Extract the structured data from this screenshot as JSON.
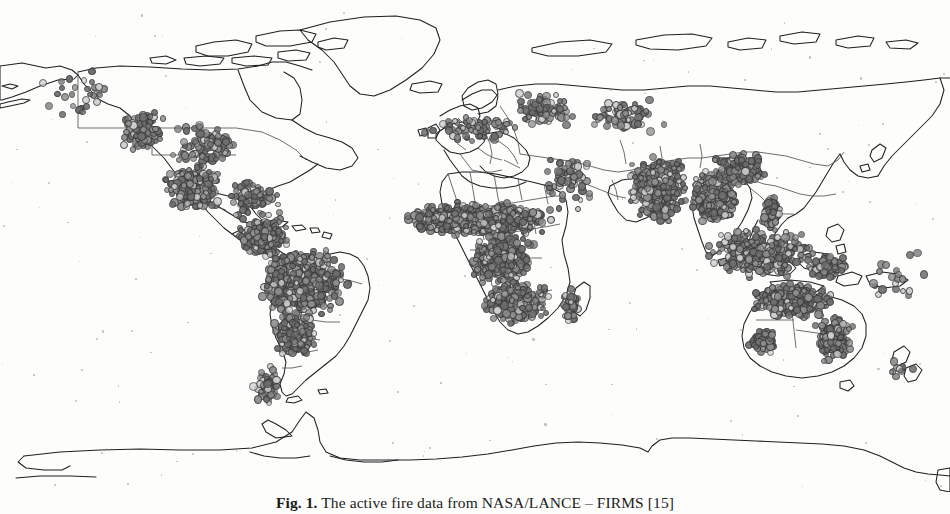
{
  "figure": {
    "label": "Fig. 1.",
    "caption_text": " The active fire data from NASA/LANCE – FIRMS [15]",
    "full_caption": "Fig. 1. The active fire data from NASA/LANCE – FIRMS [15]",
    "source": "NASA/LANCE – FIRMS",
    "reference": "[15]",
    "alt": "World map in equirectangular projection showing global active fire detections as gray circular markers"
  },
  "map": {
    "title": "Global active fire detections",
    "projection": "equirectangular",
    "background_color": "#fdfdfc",
    "coastline_color": "#1f1f1f",
    "border_color": "#4a4a4a",
    "marker_fill_dark": "#6f6f6f",
    "marker_fill_mid": "#8f8f8f",
    "marker_fill_light": "#cfcfcf",
    "marker_stroke": "#3a3a3a",
    "lon_range": [
      -168,
      190
    ],
    "lat_range": [
      -82,
      84
    ],
    "graticule": "none",
    "legend": "none",
    "axis_labels": "none"
  },
  "chart_data": {
    "type": "scatter",
    "title": "The active fire data from NASA/LANCE – FIRMS",
    "xlabel": "Longitude",
    "ylabel": "Latitude",
    "xlim": [
      -168,
      190
    ],
    "ylim": [
      -82,
      84
    ],
    "grid": false,
    "legend_position": "none",
    "series": [
      {
        "name": "Active fire detections",
        "marker": "circle",
        "marker_size_px": 7,
        "regions": [
          {
            "name": "Alaska / Pacific Northwest",
            "lon": [
              -160,
              -118
            ],
            "lat": [
              40,
              66
            ],
            "count": 30,
            "density": "sparse"
          },
          {
            "name": "Western United States",
            "lon": [
              -124,
              -104
            ],
            "lat": [
              31,
              49
            ],
            "count": 95,
            "density": "moderate"
          },
          {
            "name": "Central / Southeast United States",
            "lon": [
              -104,
              -76
            ],
            "lat": [
              27,
              44
            ],
            "count": 110,
            "density": "moderate"
          },
          {
            "name": "Mexico and Central America",
            "lon": [
              -108,
              -83
            ],
            "lat": [
              12,
              30
            ],
            "count": 300,
            "density": "very high"
          },
          {
            "name": "Caribbean",
            "lon": [
              -85,
              -61
            ],
            "lat": [
              9,
              24
            ],
            "count": 90,
            "density": "high"
          },
          {
            "name": "Northern South America / Venezuela / Colombia",
            "lon": [
              -79,
              -58
            ],
            "lat": [
              -4,
              12
            ],
            "count": 260,
            "density": "very high"
          },
          {
            "name": "Amazon Basin / Brazil",
            "lon": [
              -72,
              -36
            ],
            "lat": [
              -24,
              2
            ],
            "count": 620,
            "density": "very high"
          },
          {
            "name": "Southern Brazil / Paraguay / Argentina",
            "lon": [
              -66,
              -48
            ],
            "lat": [
              -38,
              -20
            ],
            "count": 230,
            "density": "high"
          },
          {
            "name": "Southern Cone / Patagonia",
            "lon": [
              -74,
              -62
            ],
            "lat": [
              -55,
              -38
            ],
            "count": 60,
            "density": "moderate"
          },
          {
            "name": "Iberia / Mediterranean Europe",
            "lon": [
              -10,
              30
            ],
            "lat": [
              35,
              46
            ],
            "count": 70,
            "density": "sparse"
          },
          {
            "name": "Eastern Europe / Ukraine / Caucasus",
            "lon": [
              24,
              50
            ],
            "lat": [
              40,
              54
            ],
            "count": 80,
            "density": "moderate"
          },
          {
            "name": "Central Asia / Kazakhstan",
            "lon": [
              50,
              84
            ],
            "lat": [
              38,
              52
            ],
            "count": 70,
            "density": "sparse"
          },
          {
            "name": "Sahel belt (West to East Africa)",
            "lon": [
              -17,
              42
            ],
            "lat": [
              4,
              16
            ],
            "count": 900,
            "density": "extreme"
          },
          {
            "name": "Central Africa / Congo Basin",
            "lon": [
              8,
              34
            ],
            "lat": [
              -12,
              6
            ],
            "count": 520,
            "density": "very high"
          },
          {
            "name": "Southern Africa / Zambia / Angola / Mozambique",
            "lon": [
              12,
              40
            ],
            "lat": [
              -26,
              -10
            ],
            "count": 300,
            "density": "high"
          },
          {
            "name": "Madagascar",
            "lon": [
              43,
              51
            ],
            "lat": [
              -26,
              -12
            ],
            "count": 60,
            "density": "high"
          },
          {
            "name": "Arabian Peninsula / Middle East",
            "lon": [
              34,
              60
            ],
            "lat": [
              12,
              34
            ],
            "count": 60,
            "density": "sparse"
          },
          {
            "name": "Indian subcontinent",
            "lon": [
              68,
              92
            ],
            "lat": [
              8,
              32
            ],
            "count": 560,
            "density": "extreme"
          },
          {
            "name": "Indochina / Myanmar / Thailand / Laos",
            "lon": [
              92,
              110
            ],
            "lat": [
              8,
              28
            ],
            "count": 420,
            "density": "extreme"
          },
          {
            "name": "Southern China",
            "lon": [
              100,
              122
            ],
            "lat": [
              20,
              34
            ],
            "count": 200,
            "density": "high"
          },
          {
            "name": "Maritime Southeast Asia / Indonesia / Borneo",
            "lon": [
              95,
              142
            ],
            "lat": [
              -11,
              8
            ],
            "count": 330,
            "density": "very high"
          },
          {
            "name": "Philippines",
            "lon": [
              118,
              127
            ],
            "lat": [
              5,
              19
            ],
            "count": 90,
            "density": "high"
          },
          {
            "name": "Papua New Guinea",
            "lon": [
              134,
              152
            ],
            "lat": [
              -11,
              -2
            ],
            "count": 110,
            "density": "high"
          },
          {
            "name": "Northern Australia",
            "lon": [
              113,
              148
            ],
            "lat": [
              -24,
              -11
            ],
            "count": 360,
            "density": "very high"
          },
          {
            "name": "Eastern Australia",
            "lon": [
              138,
              154
            ],
            "lat": [
              -39,
              -22
            ],
            "count": 190,
            "density": "high"
          },
          {
            "name": "Southwestern Australia",
            "lon": [
              113,
              126
            ],
            "lat": [
              -36,
              -26
            ],
            "count": 70,
            "density": "moderate"
          },
          {
            "name": "New Zealand",
            "lon": [
              166,
              179
            ],
            "lat": [
              -47,
              -34
            ],
            "count": 10,
            "density": "sparse"
          },
          {
            "name": "Pacific Islands",
            "lon": [
              155,
              185
            ],
            "lat": [
              -22,
              2
            ],
            "count": 20,
            "density": "sparse"
          }
        ],
        "notes": "No detections over Greenland, high Arctic, Sahara interior, or Antarctica"
      }
    ]
  }
}
